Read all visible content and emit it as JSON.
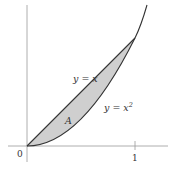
{
  "diagram": {
    "type": "area-between-curves",
    "curves": [
      {
        "name": "upper",
        "equation": "y = x",
        "label_main": "y = x",
        "label_sup": ""
      },
      {
        "name": "lower",
        "equation": "y = x^2",
        "label_main": "y = x",
        "label_sup": "2"
      }
    ],
    "region_label": "A",
    "axis_labels": {
      "origin": "0",
      "x_tick_1": "1"
    },
    "intersection_points": [
      [
        0,
        0
      ],
      [
        1,
        1
      ]
    ],
    "colors": {
      "region_fill": "#cfcfcf",
      "curve_stroke": "#333333",
      "axis_stroke": "#9a9a9a",
      "background": "#ffffff"
    }
  }
}
